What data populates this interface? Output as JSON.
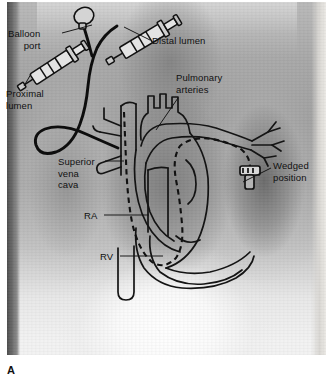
{
  "figure": {
    "panel_letter": "A",
    "modality": "chest-radiograph"
  },
  "annotations": [
    {
      "id": "balloon-port",
      "text": "Balloon\nport",
      "align": "right",
      "x": 8,
      "y": 28,
      "leader": {
        "x1": 62,
        "y1": 33,
        "x2": 92,
        "y2": 25
      }
    },
    {
      "id": "distal-lumen",
      "text": "Distal lumen",
      "align": "left",
      "x": 152,
      "y": 35,
      "leader": {
        "x1": 150,
        "y1": 40,
        "x2": 124,
        "y2": 27
      }
    },
    {
      "id": "proximal-lumen",
      "text": "Proximal\nlumen",
      "align": "left",
      "x": 6,
      "y": 88,
      "leader": {
        "x1": 24,
        "y1": 86,
        "x2": 31,
        "y2": 74
      }
    },
    {
      "id": "pulmonary-arteries",
      "text": "Pulmonary\narteries",
      "align": "left",
      "x": 176,
      "y": 72,
      "leader": {
        "x1": 178,
        "y1": 98,
        "x2": 156,
        "y2": 130
      }
    },
    {
      "id": "superior-vena-cava",
      "text": "Superior\nvena\ncava",
      "align": "left",
      "x": 58,
      "y": 156,
      "leader": {
        "x1": 105,
        "y1": 161,
        "x2": 124,
        "y2": 161
      }
    },
    {
      "id": "wedged-position",
      "text": "Wedged\nposition",
      "align": "left",
      "x": 273,
      "y": 160,
      "leader": {
        "x1": 271,
        "y1": 168,
        "x2": 243,
        "y2": 182
      }
    },
    {
      "id": "right-atrium",
      "text": "RA",
      "align": "left",
      "x": 84,
      "y": 210,
      "leader": {
        "x1": 104,
        "y1": 215,
        "x2": 149,
        "y2": 215
      }
    },
    {
      "id": "right-ventricle",
      "text": "RV",
      "align": "left",
      "x": 100,
      "y": 251,
      "leader": {
        "x1": 120,
        "y1": 256,
        "x2": 163,
        "y2": 256
      }
    }
  ],
  "colors": {
    "ink": "#111111",
    "line": "#1a1a1a",
    "film_light": "#f2f2f2",
    "film_mid": "#9d9d9d",
    "film_dark": "#4e4e4e"
  }
}
